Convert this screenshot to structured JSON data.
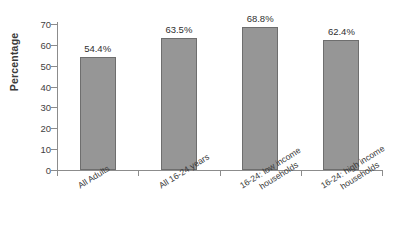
{
  "chart_data": {
    "type": "bar",
    "title": "",
    "subtitle": "",
    "xlabel": "",
    "ylabel": "Percentage",
    "ylim": [
      0,
      70
    ],
    "ytick_step": 10,
    "yticks": [
      "70",
      "60",
      "50",
      "40",
      "30",
      "20",
      "10",
      "0"
    ],
    "grid": false,
    "legend": false,
    "categories": [
      "All Adults",
      "All 16-24 years",
      "16-24: low income households",
      "16-24: high income households"
    ],
    "category_lines": [
      [
        "All Adults",
        ""
      ],
      [
        "All 16-24 years",
        ""
      ],
      [
        "16-24: low income",
        "households"
      ],
      [
        "16-24: high income",
        "households"
      ]
    ],
    "values": [
      54.4,
      63.5,
      68.8,
      62.4
    ],
    "data_labels": [
      "54.4%",
      "63.5%",
      "68.8%",
      "62.4%"
    ],
    "colors": {
      "bar_fill": "#969696",
      "bar_border": "#6e6e6e",
      "axis": "#8c8c8c",
      "text": "#3a3a3a",
      "background": "#ffffff"
    }
  }
}
